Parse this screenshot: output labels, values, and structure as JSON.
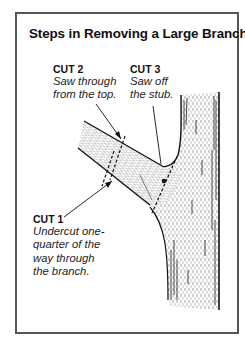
{
  "title": "Steps in Removing a Large Branch",
  "cuts": [
    {
      "heading": "CUT 1",
      "lines": [
        "Undercut one-",
        "quarter of the",
        "way through",
        "the branch."
      ]
    },
    {
      "heading": "CUT 2",
      "lines": [
        "Saw through",
        "from the top."
      ]
    },
    {
      "heading": "CUT 3",
      "lines": [
        "Saw off",
        "the stub."
      ]
    }
  ],
  "illustration": {
    "subject": "tree trunk with large side branch",
    "cut_markers": [
      "dashed-line",
      "arrow",
      "dot"
    ]
  },
  "colors": {
    "ink": "#111111",
    "border": "#555555",
    "background": "#ffffff"
  }
}
